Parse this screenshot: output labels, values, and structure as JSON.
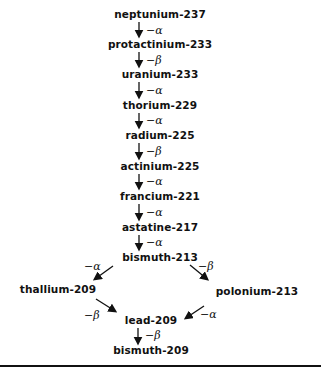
{
  "diagram": {
    "title": "",
    "type": "decay-chain",
    "nodes": [
      {
        "id": "np237",
        "label": "neptunium-237",
        "x": 160,
        "y": 14
      },
      {
        "id": "pa233",
        "label": "protactinium-233",
        "x": 160,
        "y": 44
      },
      {
        "id": "u233",
        "label": "uranium-233",
        "x": 160,
        "y": 74
      },
      {
        "id": "th229",
        "label": "thorium-229",
        "x": 160,
        "y": 105
      },
      {
        "id": "ra225",
        "label": "radium-225",
        "x": 160,
        "y": 135
      },
      {
        "id": "ac225",
        "label": "actinium-225",
        "x": 160,
        "y": 166
      },
      {
        "id": "fr221",
        "label": "francium-221",
        "x": 160,
        "y": 196
      },
      {
        "id": "at217",
        "label": "astatine-217",
        "x": 160,
        "y": 227
      },
      {
        "id": "bi213",
        "label": "bismuth-213",
        "x": 160,
        "y": 257
      },
      {
        "id": "tl209",
        "label": "thallium-209",
        "x": 58,
        "y": 289
      },
      {
        "id": "po213",
        "label": "polonium-213",
        "x": 257,
        "y": 291
      },
      {
        "id": "pb209",
        "label": "lead-209",
        "x": 151,
        "y": 320
      },
      {
        "id": "bi209",
        "label": "bismuth-209",
        "x": 151,
        "y": 350
      }
    ],
    "edges": [
      {
        "from": "np237",
        "to": "pa233",
        "label": "−α"
      },
      {
        "from": "pa233",
        "to": "u233",
        "label": "−β"
      },
      {
        "from": "u233",
        "to": "th229",
        "label": "−α"
      },
      {
        "from": "th229",
        "to": "ra225",
        "label": "−α"
      },
      {
        "from": "ra225",
        "to": "ac225",
        "label": "−β"
      },
      {
        "from": "ac225",
        "to": "fr221",
        "label": "−α"
      },
      {
        "from": "fr221",
        "to": "at217",
        "label": "−α"
      },
      {
        "from": "at217",
        "to": "bi213",
        "label": "−α"
      },
      {
        "from": "bi213",
        "to": "tl209",
        "label": "−α"
      },
      {
        "from": "bi213",
        "to": "po213",
        "label": "−β"
      },
      {
        "from": "tl209",
        "to": "pb209",
        "label": "−β"
      },
      {
        "from": "po213",
        "to": "pb209",
        "label": "−α"
      },
      {
        "from": "pb209",
        "to": "bi209",
        "label": "−β"
      }
    ]
  },
  "labels": {
    "np237": "neptunium-237",
    "pa233": "protactinium-233",
    "u233": "uranium-233",
    "th229": "thorium-229",
    "ra225": "radium-225",
    "ac225": "actinium-225",
    "fr221": "francium-221",
    "at217": "astatine-217",
    "bi213": "bismuth-213",
    "tl209": "thallium-209",
    "po213": "polonium-213",
    "pb209": "lead-209",
    "bi209": "bismuth-209"
  },
  "decay": {
    "e1": "−α",
    "e2": "−β",
    "e3": "−α",
    "e4": "−α",
    "e5": "−β",
    "e6": "−α",
    "e7": "−α",
    "e8": "−α",
    "e9": "−α",
    "e10": "−β",
    "e11": "−β",
    "e12": "−α",
    "e13": "−β"
  },
  "colors": {
    "ink": "#111111",
    "background": "#ffffff"
  }
}
